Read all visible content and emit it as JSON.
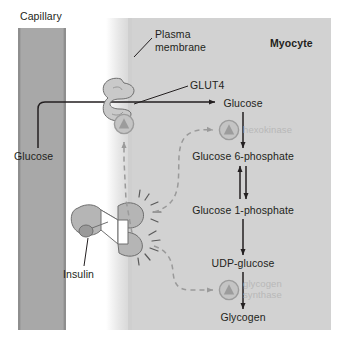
{
  "figure": {
    "caption": ""
  },
  "regions": {
    "capillary": {
      "label": "Capillary",
      "color": "#a8a8a8"
    },
    "membrane": {
      "label_line1": "Plasma",
      "label_line2": "membrane",
      "color": "#dcdcdc"
    },
    "cytoplasm": {
      "label": "Myocyte",
      "color": "#d2d2d2"
    }
  },
  "transporter": {
    "label": "GLUT4",
    "color": "#c9c9c9"
  },
  "receptor": {
    "label": "Insulin",
    "color": "#b5b5b5"
  },
  "pathway": {
    "blood_glucose": "Glucose",
    "steps": [
      {
        "id": "glucose",
        "label": "Glucose",
        "x": 243,
        "y": 104
      },
      {
        "id": "g6p",
        "label": "Glucose 6-phosphate",
        "x": 243,
        "y": 157
      },
      {
        "id": "g1p",
        "label": "Glucose 1-phosphate",
        "x": 243,
        "y": 211
      },
      {
        "id": "udp_glucose",
        "label": "UDP-glucose",
        "x": 243,
        "y": 264
      },
      {
        "id": "glycogen",
        "label": "Glycogen",
        "x": 243,
        "y": 318
      }
    ]
  },
  "enzymes": [
    {
      "id": "hexokinase",
      "label_line1": "hexokinase",
      "label_line2": "",
      "color": "#c4c4c4"
    },
    {
      "id": "glycogen_synthase",
      "label_line1": "glycogen",
      "label_line2": "synthase",
      "color": "#c4c4c4"
    }
  ],
  "symbols": {
    "activation": "circle-with-up-triangle"
  },
  "colors": {
    "stroke": "#231f20",
    "dashed_signal": "#9a9a9a",
    "enzyme_text": "#b8b8b8",
    "capillary_fill": "#a8a8a8",
    "cytoplasm_fill": "#d2d2d2",
    "membrane_fill": "#dcdcdc",
    "shape_fill": "#c9c9c9"
  }
}
